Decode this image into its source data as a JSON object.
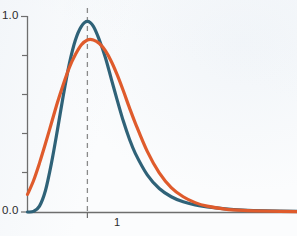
{
  "chart_data": {
    "type": "line",
    "title": "",
    "xlabel": "",
    "ylabel": "",
    "xlim": [
      0,
      4.5
    ],
    "ylim": [
      0.0,
      1.0
    ],
    "grid": false,
    "legend": null,
    "y_ticks": [
      {
        "value": 1.0,
        "label": "1.0"
      },
      {
        "value": 0.8,
        "label": ""
      },
      {
        "value": 0.6,
        "label": ""
      },
      {
        "value": 0.4,
        "label": ""
      },
      {
        "value": 0.2,
        "label": ""
      },
      {
        "value": 0.0,
        "label": "0.0"
      }
    ],
    "x_ticks": [
      {
        "value": 1,
        "label": "1"
      }
    ],
    "annotations": [
      {
        "name": "vertical-dashed-line",
        "kind": "vline",
        "x": 1,
        "style": "dashed",
        "color": "#8a8a8a"
      }
    ],
    "series": [
      {
        "name": "teal-curve",
        "color": "#2f6278",
        "width": 3.2,
        "x": [
          0.0,
          0.1,
          0.2,
          0.3,
          0.4,
          0.5,
          0.6,
          0.7,
          0.8,
          0.9,
          1.0,
          1.1,
          1.2,
          1.3,
          1.4,
          1.5,
          1.6,
          1.7,
          1.8,
          2.0,
          2.2,
          2.4,
          2.6,
          2.8,
          3.0,
          3.3,
          3.6,
          4.0,
          4.5
        ],
        "y": [
          0.0,
          0.003,
          0.03,
          0.11,
          0.25,
          0.42,
          0.6,
          0.76,
          0.88,
          0.95,
          0.975,
          0.95,
          0.88,
          0.79,
          0.68,
          0.57,
          0.465,
          0.375,
          0.3,
          0.19,
          0.12,
          0.078,
          0.052,
          0.036,
          0.026,
          0.016,
          0.01,
          0.006,
          0.003
        ]
      },
      {
        "name": "orange-curve",
        "color": "#df5b2c",
        "width": 3.2,
        "x": [
          0.0,
          0.1,
          0.2,
          0.3,
          0.4,
          0.5,
          0.6,
          0.7,
          0.8,
          0.9,
          1.0,
          1.1,
          1.2,
          1.3,
          1.4,
          1.5,
          1.6,
          1.7,
          1.8,
          2.0,
          2.2,
          2.4,
          2.6,
          2.8,
          3.0,
          3.3,
          3.6,
          4.0,
          4.5
        ],
        "y": [
          0.09,
          0.16,
          0.25,
          0.35,
          0.455,
          0.56,
          0.655,
          0.74,
          0.805,
          0.855,
          0.88,
          0.88,
          0.862,
          0.825,
          0.77,
          0.7,
          0.62,
          0.535,
          0.455,
          0.31,
          0.2,
          0.125,
          0.078,
          0.048,
          0.03,
          0.015,
          0.008,
          0.004,
          0.002
        ]
      }
    ]
  },
  "axis": {
    "y_top_label": "1.0",
    "y_bottom_label": "0.0",
    "x_tick_label": "1",
    "axis_color": "#6e6e6e"
  }
}
